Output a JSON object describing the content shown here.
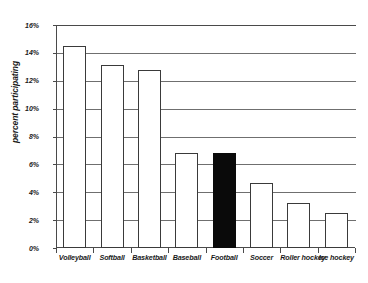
{
  "chart_data": {
    "type": "bar",
    "title": "",
    "subtitle": "",
    "xlabel": "",
    "ylabel": "percent participating",
    "ylim": [
      0,
      16
    ],
    "y_tick_labels": [
      "0%",
      "2%",
      "4%",
      "6%",
      "8%",
      "10%",
      "12%",
      "14%",
      "16%"
    ],
    "y_tick_values": [
      0,
      2,
      4,
      6,
      8,
      10,
      12,
      14,
      16
    ],
    "grid": true,
    "legend": false,
    "legend_position": "none",
    "categories": [
      "Volleyball",
      "Softball",
      "Basketball",
      "Baseball",
      "Football",
      "Soccer",
      "Roller hockey",
      "Ice hockey"
    ],
    "values": [
      14.5,
      13.1,
      12.8,
      6.8,
      6.8,
      4.7,
      3.2,
      2.5
    ],
    "bar_styles": [
      "open",
      "open",
      "open",
      "open",
      "filled",
      "open",
      "open",
      "open"
    ],
    "highlight_category": "Football",
    "colors": {
      "background": "#ffffff",
      "bar_fill": "#ffffff",
      "bar_outline": "#3a3a3a",
      "bar_highlight_fill": "#0a0a0a",
      "gridline": "#6f6f6f",
      "axis": "#4a4a4a",
      "text": "#1a1a1a"
    }
  }
}
